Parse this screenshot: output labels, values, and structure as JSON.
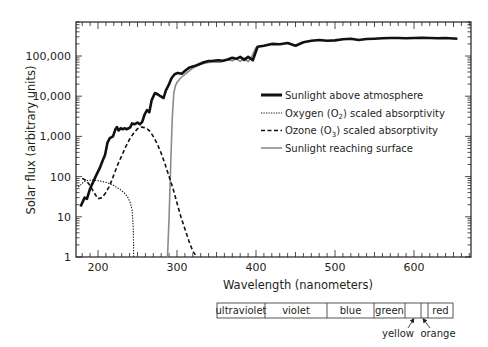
{
  "chart_data": {
    "type": "line",
    "title": "",
    "xlabel": "Wavelength  (nanometers)",
    "ylabel": "Solar flux  (arbitrary units)",
    "yscale": "log",
    "xlim": [
      172,
      672
    ],
    "ylim": [
      1,
      700000
    ],
    "grid": false,
    "legend_position": "inside center-right",
    "x_ticks": [
      200,
      300,
      400,
      500,
      600
    ],
    "x_tick_labels": [
      "200",
      "300",
      "400",
      "500",
      "600"
    ],
    "y_ticks": [
      1,
      10,
      100,
      1000,
      10000,
      100000
    ],
    "y_tick_labels": [
      "1",
      "10",
      "100",
      "1,000",
      "10,000",
      "100,000"
    ],
    "series": [
      {
        "name": "Sunlight above atmosphere",
        "style": "thick-solid",
        "color": "#111111",
        "x": [
          178,
          183,
          186,
          190,
          194,
          198,
          202,
          206,
          209,
          212,
          215,
          219,
          222,
          224,
          226,
          229,
          231,
          234,
          236,
          239,
          241,
          243,
          246,
          250,
          253,
          256,
          259,
          262,
          265,
          268,
          272,
          276,
          279,
          283,
          286,
          290,
          293,
          297,
          301,
          306,
          311,
          316,
          322,
          328,
          334,
          340,
          346,
          352,
          358,
          364,
          370,
          375,
          380,
          385,
          390,
          396,
          402,
          410,
          420,
          430,
          440,
          450,
          460,
          470,
          480,
          490,
          500,
          510,
          520,
          530,
          540,
          550,
          560,
          570,
          580,
          590,
          600,
          610,
          620,
          630,
          640,
          655
        ],
        "y": [
          18,
          30,
          28,
          50,
          75,
          110,
          160,
          250,
          350,
          700,
          900,
          1000,
          1500,
          1700,
          1400,
          1600,
          1500,
          1600,
          1500,
          1600,
          1700,
          2100,
          2000,
          2200,
          2000,
          2300,
          3500,
          4500,
          4000,
          8000,
          12000,
          11000,
          10000,
          9000,
          14000,
          20000,
          28000,
          35000,
          38000,
          36000,
          44000,
          52000,
          56000,
          62000,
          70000,
          75000,
          76000,
          78000,
          76000,
          82000,
          90000,
          85000,
          95000,
          80000,
          95000,
          78000,
          170000,
          180000,
          200000,
          195000,
          210000,
          180000,
          220000,
          240000,
          250000,
          240000,
          245000,
          260000,
          270000,
          250000,
          265000,
          270000,
          275000,
          280000,
          280000,
          275000,
          280000,
          285000,
          280000,
          275000,
          280000,
          270000
        ]
      },
      {
        "name": "Oxygen (O2) scaled absorptivity",
        "style": "dotted",
        "color": "#111111",
        "x": [
          175,
          178,
          182,
          187,
          192,
          198,
          205,
          212,
          220,
          228,
          234,
          238,
          241,
          243,
          244.5,
          245,
          245
        ],
        "y": [
          55,
          62,
          75,
          80,
          82,
          80,
          76,
          70,
          60,
          48,
          38,
          30,
          22,
          15,
          6,
          2,
          1
        ]
      },
      {
        "name": "Ozone (O3) scaled absorptivity",
        "style": "dashed",
        "color": "#111111",
        "x": [
          180,
          185,
          190,
          195,
          200,
          205,
          210,
          215,
          220,
          225,
          230,
          235,
          240,
          245,
          250,
          255,
          260,
          265,
          270,
          275,
          280,
          285,
          290,
          295,
          300,
          305,
          310,
          315,
          320,
          325
        ],
        "y": [
          90,
          80,
          60,
          40,
          28,
          30,
          40,
          60,
          110,
          200,
          330,
          550,
          850,
          1200,
          1550,
          1700,
          1650,
          1400,
          1000,
          650,
          380,
          200,
          100,
          50,
          22,
          10,
          5,
          2.5,
          1.4,
          1
        ]
      },
      {
        "name": "Sunlight reaching surface",
        "style": "solid-gray",
        "color": "#8a8a8a",
        "x": [
          288,
          290,
          292,
          294,
          296,
          298,
          300,
          303,
          306,
          310,
          315,
          320,
          325,
          330,
          335,
          340,
          345,
          350,
          355,
          360,
          365,
          370,
          375,
          380,
          385,
          390,
          395,
          400
        ],
        "y": [
          1,
          10,
          200,
          3000,
          12000,
          18000,
          22000,
          26000,
          30000,
          35000,
          42000,
          50000,
          56000,
          62000,
          66000,
          69000,
          70000,
          71000,
          70000,
          76000,
          80000,
          76000,
          86000,
          74000,
          88000,
          72000,
          100000,
          165000
        ]
      }
    ]
  },
  "axes": {
    "y_title": "Solar flux  (arbitrary units)",
    "x_title": "Wavelength  (nanometers)",
    "y_tick_labels": [
      "1",
      "10",
      "100",
      "1,000",
      "10,000",
      "100,000"
    ],
    "x_tick_labels": [
      "200",
      "300",
      "400",
      "500",
      "600"
    ]
  },
  "legend": {
    "items": [
      {
        "label": "Sunlight above atmosphere",
        "style": "thick-solid"
      },
      {
        "label_pre": "Oxygen (O",
        "sub": "2",
        "label_post": ") scaled absorptivity",
        "style": "dotted"
      },
      {
        "label_pre": "Ozone (O",
        "sub": "3",
        "label_post": ") scaled absorptivity",
        "style": "dashed"
      },
      {
        "label": "Sunlight reaching surface",
        "style": "solid-gray"
      }
    ]
  },
  "spectrum_bar": {
    "bands": [
      {
        "label": "ultraviolet",
        "x0": 217,
        "x1": 265
      },
      {
        "label": "violet",
        "x0": 265,
        "x1": 327
      },
      {
        "label": "blue",
        "x0": 327,
        "x1": 374
      },
      {
        "label": "green",
        "x0": 374,
        "x1": 405
      },
      {
        "label": "",
        "x0": 405,
        "x1": 421
      },
      {
        "label": "",
        "x0": 421,
        "x1": 428
      },
      {
        "label": "red",
        "x0": 428,
        "x1": 453
      }
    ],
    "callouts": [
      {
        "label": "yellow",
        "target_x": 413
      },
      {
        "label": "orange",
        "target_x": 424
      }
    ]
  },
  "colors": {
    "ink": "#231f20",
    "surface_line": "#8a8a8a"
  }
}
